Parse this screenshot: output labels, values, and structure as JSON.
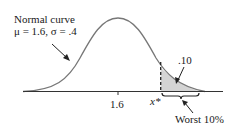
{
  "diagram": {
    "curve_label_line1": "Normal curve",
    "curve_label_line2": "μ = 1.6, σ = .4",
    "mean_tick_label": "1.6",
    "cutoff_label": "x*",
    "tail_area_label": ".10",
    "bracket_label": "Worst 10%",
    "colors": {
      "curve": "#777777",
      "axis": "#333333",
      "shade": "#d4d4d4",
      "text": "#1a1a1a"
    }
  }
}
